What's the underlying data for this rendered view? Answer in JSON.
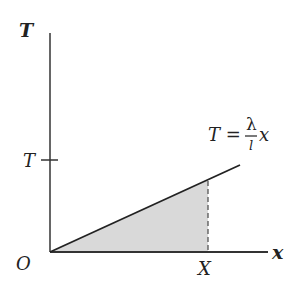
{
  "diagram": {
    "type": "tension-extension graph",
    "y_axis_label": "T",
    "x_axis_label": "x",
    "origin_label": "O",
    "y_tick_label": "T",
    "x_marker_label": "X",
    "equation": {
      "lhs": "T =",
      "numerator": "λ",
      "denominator": "l",
      "variable": "x"
    },
    "shaded_region": "area under line from O to X",
    "colors": {
      "line": "#222222",
      "shade": "#d9d9d9",
      "background": "#ffffff"
    }
  }
}
